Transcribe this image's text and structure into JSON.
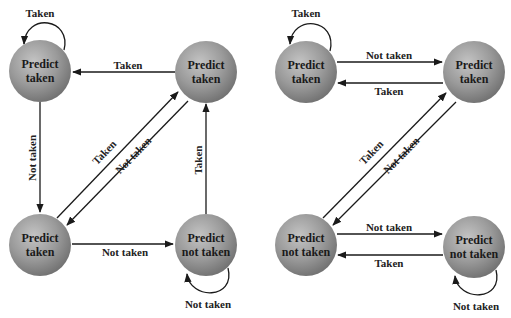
{
  "diagrams": [
    {
      "name": "left-state-machine",
      "states": [
        {
          "id": "s1",
          "line1": "Predict",
          "line2": "taken",
          "cx": 40,
          "cy": 71
        },
        {
          "id": "s2",
          "line1": "Predict",
          "line2": "taken",
          "cx": 206,
          "cy": 72
        },
        {
          "id": "s3",
          "line1": "Predict",
          "line2": "taken",
          "cx": 40,
          "cy": 245
        },
        {
          "id": "s4",
          "line1": "Predict",
          "line2": "not taken",
          "cx": 206,
          "cy": 245
        }
      ],
      "edges": [
        {
          "from": "s1",
          "to": "s1",
          "label": "Taken"
        },
        {
          "from": "s2",
          "to": "s1",
          "label": "Taken"
        },
        {
          "from": "s1",
          "to": "s3",
          "label": "Not taken"
        },
        {
          "from": "s3",
          "to": "s2",
          "label": "Taken"
        },
        {
          "from": "s2",
          "to": "s3",
          "label": "Not taken"
        },
        {
          "from": "s4",
          "to": "s2",
          "label": "Taken"
        },
        {
          "from": "s3",
          "to": "s4",
          "label": "Not taken"
        },
        {
          "from": "s4",
          "to": "s4",
          "label": "Not taken"
        }
      ]
    },
    {
      "name": "right-state-machine",
      "states": [
        {
          "id": "r1",
          "line1": "Predict",
          "line2": "taken",
          "cx": 306,
          "cy": 72
        },
        {
          "id": "r2",
          "line1": "Predict",
          "line2": "taken",
          "cx": 474,
          "cy": 72
        },
        {
          "id": "r3",
          "line1": "Predict",
          "line2": "not taken",
          "cx": 306,
          "cy": 245
        },
        {
          "id": "r4",
          "line1": "Predict",
          "line2": "not taken",
          "cx": 474,
          "cy": 247
        }
      ],
      "edges": [
        {
          "from": "r1",
          "to": "r1",
          "label": "Taken"
        },
        {
          "from": "r1",
          "to": "r2",
          "label": "Not taken"
        },
        {
          "from": "r2",
          "to": "r1",
          "label": "Taken"
        },
        {
          "from": "r3",
          "to": "r2",
          "label": "Taken"
        },
        {
          "from": "r2",
          "to": "r3",
          "label": "Not taken"
        },
        {
          "from": "r3",
          "to": "r4",
          "label": "Not taken"
        },
        {
          "from": "r4",
          "to": "r3",
          "label": "Taken"
        },
        {
          "from": "r4",
          "to": "r4",
          "label": "Not taken"
        }
      ]
    }
  ],
  "labels": {
    "taken": "Taken",
    "not_taken": "Not taken",
    "predict": "Predict",
    "predict_taken_2": "taken",
    "predict_not_taken_2": "not taken"
  }
}
